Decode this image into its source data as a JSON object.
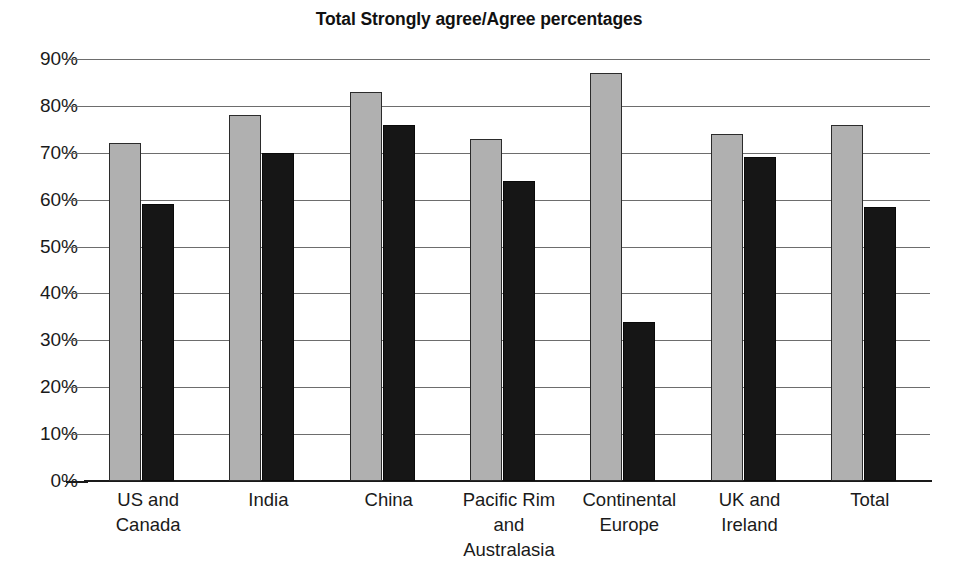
{
  "chart_data": {
    "type": "bar",
    "title": "Total Strongly agree/Agree percentages",
    "xlabel": "",
    "ylabel": "",
    "ylim": [
      0,
      90
    ],
    "ytick_labels": [
      "90%",
      "80%",
      "70%",
      "60%",
      "50%",
      "40%",
      "30%",
      "20%",
      "10%",
      "0%"
    ],
    "ytick_values": [
      90,
      80,
      70,
      60,
      50,
      40,
      30,
      20,
      10,
      0
    ],
    "grid": true,
    "legend": "none",
    "categories": [
      "US and Canada",
      "India",
      "China",
      "Pacific Rim and Australasia",
      "Continental Europe",
      "UK and Ireland",
      "Total"
    ],
    "category_lines": [
      [
        "US and",
        "Canada"
      ],
      [
        "India"
      ],
      [
        "China"
      ],
      [
        "Pacific Rim",
        "and",
        "Australasia"
      ],
      [
        "Continental",
        "Europe"
      ],
      [
        "UK and",
        "Ireland"
      ],
      [
        "Total"
      ]
    ],
    "series": [
      {
        "name": "Series 1",
        "color": "#b0b0b0",
        "values": [
          72,
          78,
          83,
          73,
          87,
          74,
          76
        ]
      },
      {
        "name": "Series 2",
        "color": "#161616",
        "values": [
          59,
          70,
          76,
          64,
          34,
          69,
          58.5
        ]
      }
    ]
  }
}
